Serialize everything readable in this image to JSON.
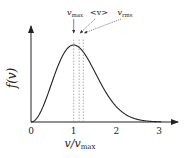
{
  "chart_data": {
    "type": "line",
    "title": "",
    "xlabel": "v/v_max",
    "ylabel": "f(v)",
    "xlim": [
      0,
      3.4
    ],
    "ylim": [
      0,
      1.2
    ],
    "x_ticks": [
      "0",
      "1",
      "2",
      "3"
    ],
    "x_tick_values": [
      0,
      1,
      2,
      3
    ],
    "grid": false,
    "series": [
      {
        "name": "Maxwell-Boltzmann distribution f(v)",
        "function": "x^2 * exp(1 - x^2)",
        "peak": [
          1,
          1
        ]
      }
    ],
    "annotations": [
      {
        "label": "v_max",
        "x": 1.0
      },
      {
        "label": "<v>",
        "x": 1.128
      },
      {
        "label": "v_rms",
        "x": 1.225
      }
    ]
  }
}
